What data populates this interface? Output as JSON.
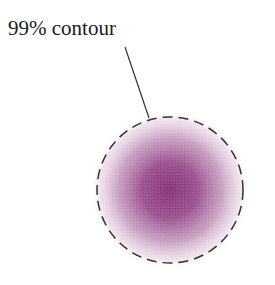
{
  "figure": {
    "label": "99% contour",
    "blob": {
      "cx": 170,
      "cy": 190,
      "r": 73,
      "center_color": "#8a3a7e",
      "edge_color": "#ffffff"
    },
    "contour": {
      "cx": 170,
      "cy": 190,
      "r": 73,
      "stroke": "#333333",
      "dash": "10 6"
    },
    "leader": {
      "x1": 125,
      "y1": 47,
      "x2": 149,
      "y2": 118,
      "stroke": "#333333"
    }
  }
}
